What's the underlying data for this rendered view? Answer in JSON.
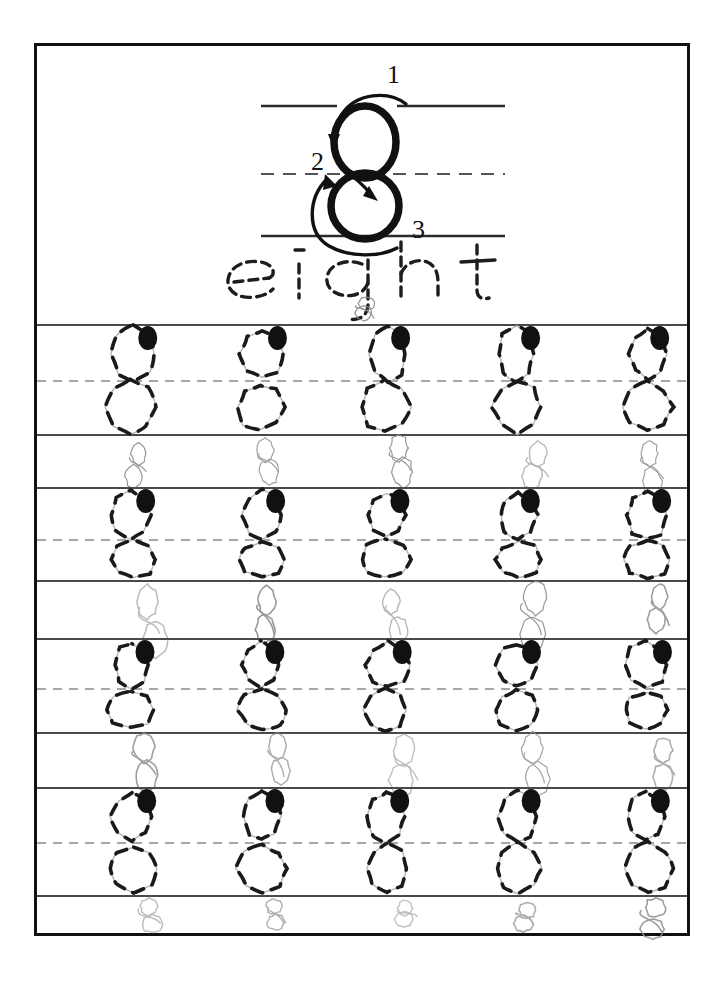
{
  "worksheet": {
    "title": "Number 8 Tracing Practice Worksheet",
    "number_digit": "8",
    "number_word": "eight",
    "frame_color": "#111111",
    "rule_color": "#4a4a4a",
    "dashed_rule_color": "#8a8a8a",
    "start_dot_color": "#111111",
    "trace_stroke_color": "#1a1a1a",
    "pencil_stroke_color": "#8e8e8e"
  },
  "header": {
    "model_digit": "8",
    "word": "eight",
    "stroke_steps": [
      {
        "label": "1",
        "hint": "start top right, curve left and down"
      },
      {
        "label": "2",
        "hint": "cross through middle"
      },
      {
        "label": "3",
        "hint": "loop around bottom back to start"
      }
    ],
    "guide_lines": {
      "top": "solid",
      "middle": "dashed",
      "bottom": "solid"
    }
  },
  "practice": {
    "rows": 4,
    "columns": 5,
    "trace_char": "8",
    "band_labels": [
      "row-1",
      "row-2",
      "row-3",
      "row-4"
    ],
    "bands": [
      {
        "name": "row-1",
        "top": 279,
        "mid": 335,
        "bottom": 389,
        "scrawl_top": 392
      },
      {
        "name": "row-2",
        "top": 442,
        "mid": 494,
        "bottom": 535,
        "scrawl_top": 538
      },
      {
        "name": "row-3",
        "top": 593,
        "mid": 643,
        "bottom": 687,
        "scrawl_top": 690
      },
      {
        "name": "row-4",
        "top": 742,
        "mid": 797,
        "bottom": 850,
        "scrawl_top": 853
      }
    ],
    "column_centers": [
      95,
      225,
      350,
      480,
      610
    ]
  }
}
